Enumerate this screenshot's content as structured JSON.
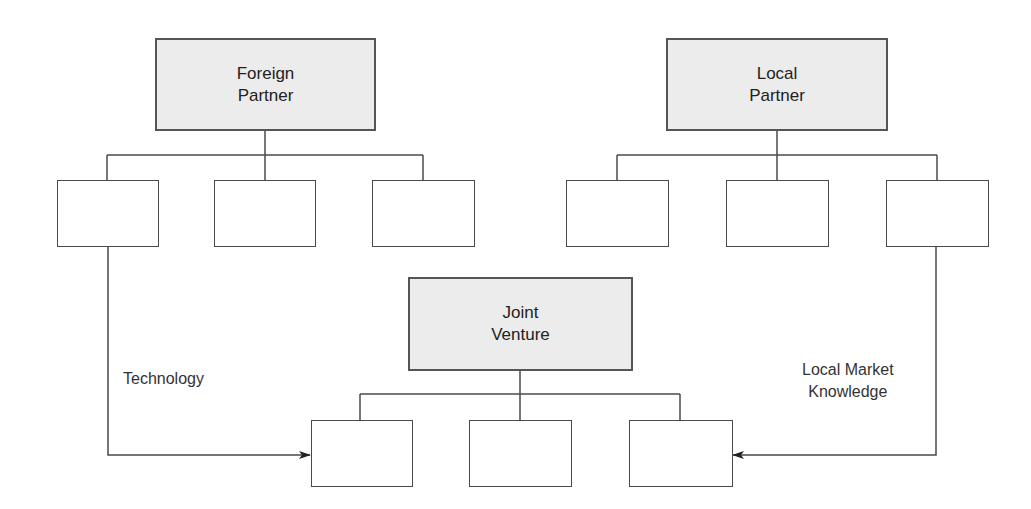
{
  "diagram": {
    "nodes": {
      "foreign_partner": {
        "line1": "Foreign",
        "line2": "Partner"
      },
      "local_partner": {
        "line1": "Local",
        "line2": "Partner"
      },
      "joint_venture": {
        "line1": "Joint",
        "line2": "Venture"
      }
    },
    "children_counts": {
      "foreign_partner": 3,
      "local_partner": 3,
      "joint_venture": 3
    },
    "edges": [
      {
        "from": "foreign_partner.child_1",
        "to": "joint_venture.child_1",
        "label": "Technology"
      },
      {
        "from": "local_partner.child_3",
        "to": "joint_venture.child_3",
        "label_line1": "Local Market",
        "label_line2": "Knowledge"
      }
    ],
    "colors": {
      "shaded_box": "#ececec",
      "line": "#4a4a4a"
    }
  }
}
